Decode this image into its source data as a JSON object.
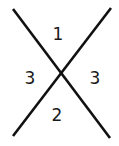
{
  "diagram": {
    "lines": [
      {
        "x1": 13,
        "y1": 9,
        "x2": 110,
        "y2": 138
      },
      {
        "x1": 111,
        "y1": 8,
        "x2": 13,
        "y2": 136
      }
    ],
    "labels": {
      "top": "1",
      "left": "3",
      "right": "3",
      "bottom": "2"
    },
    "line_color": "#111111"
  }
}
